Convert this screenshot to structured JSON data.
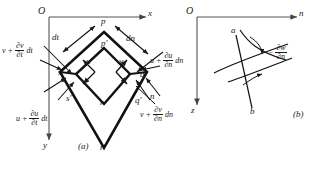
{
  "figure": {
    "caption_a": "(a)",
    "caption_b": "(b)"
  },
  "panel_a": {
    "origin": "O",
    "axis_x": "x",
    "axis_y": "y",
    "points": {
      "p": "p",
      "p_prime": "p'",
      "q": "q",
      "q_prime": "q'",
      "r": "r",
      "r_prime": "r'",
      "s": "s",
      "s_prime": "s'"
    },
    "dimensions": {
      "dt": "dt",
      "dn": "dn",
      "n_axis": "n"
    },
    "velocities": {
      "u": "u",
      "v": "v"
    },
    "expressions": {
      "v_dt": {
        "base": "v +",
        "num": "∂v",
        "den": "∂t",
        "tail": "dt"
      },
      "u_dt": {
        "base": "u +",
        "num": "∂u",
        "den": "∂t",
        "tail": "dt"
      },
      "u_dn": {
        "base": "u +",
        "num": "∂u",
        "den": "∂n",
        "tail": "dn"
      },
      "v_dn": {
        "base": "v +",
        "num": "∂v",
        "den": "∂n",
        "tail": "dn"
      }
    }
  },
  "panel_b": {
    "origin": "O",
    "axis_n": "n",
    "axis_z": "z",
    "curve_a": "a",
    "curve_b": "b",
    "slope_label": {
      "base": "−",
      "num": "∂w",
      "den": "∂n"
    }
  },
  "colors": {
    "ink": "#1a1a1a",
    "axis": "#555555",
    "background": "#ffffff"
  }
}
